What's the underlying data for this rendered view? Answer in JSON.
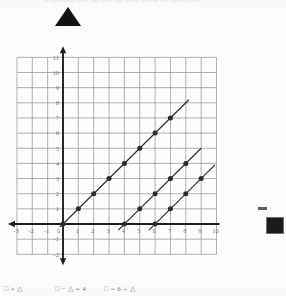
{
  "page": {
    "header_text": "Graph each line and find the point where the lines cross",
    "background_color": "#fdfdfd"
  },
  "markers": {
    "triangle": {
      "name": "triangle-symbol",
      "color": "#111111"
    },
    "square": {
      "name": "square-symbol",
      "color": "#1b1b1b"
    }
  },
  "legend": {
    "items": [
      {
        "id": "legend-1",
        "text": "□ = △"
      },
      {
        "id": "legend-2",
        "text": "□ − △ = 4"
      },
      {
        "id": "legend-3",
        "text": "□ = 6 ÷ △"
      }
    ]
  },
  "chart_data": {
    "type": "line",
    "title": "",
    "xlabel": "",
    "ylabel": "",
    "xlim": [
      -3,
      10
    ],
    "ylim": [
      -2,
      11
    ],
    "grid": true,
    "legend_position": "bottom",
    "x_ticks": [
      -3,
      -2,
      -1,
      0,
      1,
      2,
      3,
      4,
      5,
      6,
      7,
      8,
      9,
      10
    ],
    "y_ticks": [
      -2,
      -1,
      0,
      1,
      2,
      3,
      4,
      5,
      6,
      7,
      8,
      9,
      10,
      11
    ],
    "x_tick_labels": [
      "-3",
      "-2",
      "-1",
      "0",
      "1",
      "2",
      "3",
      "4",
      "5",
      "6",
      "7",
      "8",
      "9",
      "10"
    ],
    "y_tick_labels": [
      "-2",
      "-1",
      "",
      "1",
      "2",
      "3",
      "4",
      "5",
      "6",
      "7",
      "8",
      "9",
      "10",
      "11"
    ],
    "series": [
      {
        "name": "□ = △",
        "equation": "y = x",
        "color": "#2b2b2b",
        "marked_points": [
          [
            0,
            0
          ],
          [
            1,
            1
          ],
          [
            2,
            2
          ],
          [
            3,
            3
          ],
          [
            4,
            4
          ],
          [
            5,
            5
          ],
          [
            6,
            6
          ],
          [
            7,
            7
          ]
        ],
        "line_from": [
          -0.2,
          -0.2
        ],
        "line_to": [
          8.2,
          8.2
        ]
      },
      {
        "name": "□ − △ = 4",
        "equation": "y = x - 4",
        "color": "#2b2b2b",
        "marked_points": [
          [
            4,
            0
          ],
          [
            5,
            1
          ],
          [
            6,
            2
          ],
          [
            7,
            3
          ],
          [
            8,
            4
          ]
        ],
        "line_from": [
          3.6,
          -0.4
        ],
        "line_to": [
          9.0,
          5.0
        ]
      },
      {
        "name": "□ = 6 ÷ △",
        "equation": "y = x - 6",
        "color": "#2b2b2b",
        "marked_points": [
          [
            6,
            0
          ],
          [
            7,
            1
          ],
          [
            8,
            2
          ],
          [
            9,
            3
          ]
        ],
        "line_from": [
          5.6,
          -0.4
        ],
        "line_to": [
          9.9,
          3.9
        ]
      }
    ]
  }
}
